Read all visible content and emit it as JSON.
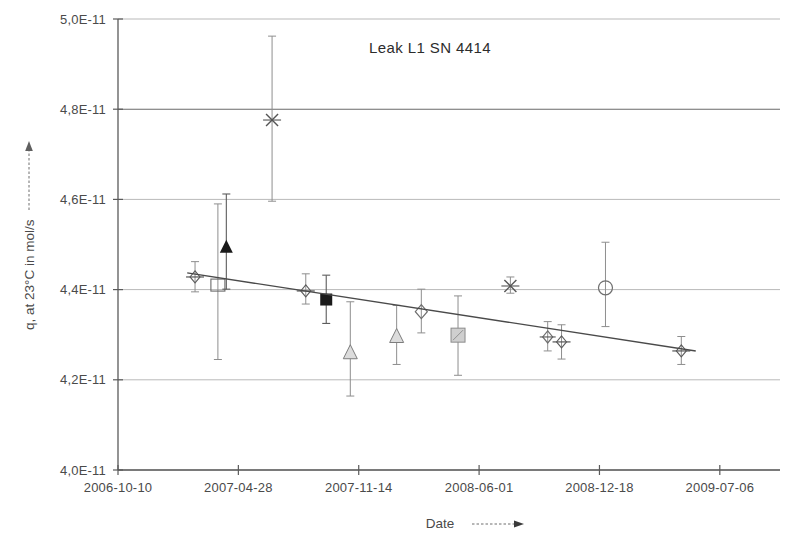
{
  "chart_data": {
    "type": "scatter",
    "title": "Leak L1 SN 4414",
    "xlabel": "Date",
    "ylabel": "q, at 23°C in mol/s",
    "xlabel_arrow": "→",
    "ylabel_arrow": "↑",
    "grid": true,
    "legend": "none",
    "ylim": [
      4e-11,
      5e-11
    ],
    "ytick_labels": [
      "5,0E-11",
      "4,8E-11",
      "4,6E-11",
      "4,4E-11",
      "4,2E-11",
      "4,0E-11"
    ],
    "ytick_values": [
      5e-11,
      4.8e-11,
      4.6e-11,
      4.4e-11,
      4.2e-11,
      4e-11
    ],
    "xtick_labels": [
      "2006-10-10",
      "2007-04-28",
      "2007-11-14",
      "2008-06-01",
      "2008-12-18",
      "2009-07-06"
    ],
    "xtick_values": [
      0,
      200,
      400,
      600,
      800,
      1000
    ],
    "xlim": [
      0,
      1100
    ],
    "points": [
      {
        "label": "2007-02-20",
        "x": 128,
        "y": 4.428e-11,
        "err_low": 4.395e-11,
        "err_high": 4.462e-11,
        "marker": "plus-diamond",
        "fill": "#555555"
      },
      {
        "label": "2007-03-28",
        "x": 166,
        "y": 4.41e-11,
        "err_low": 4.245e-11,
        "err_high": 4.59e-11,
        "marker": "open-square",
        "fill": "none"
      },
      {
        "label": "2007-05-02",
        "x": 180,
        "y": 4.493e-11,
        "err_low": 4.401e-11,
        "err_high": 4.612e-11,
        "marker": "filled-triangle",
        "fill": "#1a1a1a"
      },
      {
        "label": "2007-06-14",
        "x": 256,
        "y": 4.776e-11,
        "err_low": 4.596e-11,
        "err_high": 4.962e-11,
        "marker": "x-cross",
        "fill": "#555555"
      },
      {
        "label": "2007-08-10",
        "x": 312,
        "y": 4.397e-11,
        "err_low": 4.368e-11,
        "err_high": 4.435e-11,
        "marker": "plus-diamond",
        "fill": "#555555"
      },
      {
        "label": "2007-10-12",
        "x": 346,
        "y": 4.378e-11,
        "err_low": 4.325e-11,
        "err_high": 4.432e-11,
        "marker": "filled-square",
        "fill": "#1a1a1a"
      },
      {
        "label": "2007-12-01",
        "x": 386,
        "y": 4.26e-11,
        "err_low": 4.164e-11,
        "err_high": 4.373e-11,
        "marker": "open-triangle",
        "fill": "#d6d6d6"
      },
      {
        "label": "2008-02-20",
        "x": 463,
        "y": 4.296e-11,
        "err_low": 4.234e-11,
        "err_high": 4.365e-11,
        "marker": "open-triangle",
        "fill": "#d6d6d6"
      },
      {
        "label": "2008-04-01",
        "x": 504,
        "y": 4.351e-11,
        "err_low": 4.304e-11,
        "err_high": 4.401e-11,
        "marker": "open-diamond",
        "fill": "none"
      },
      {
        "label": "2008-06-20",
        "x": 565,
        "y": 4.299e-11,
        "err_low": 4.21e-11,
        "err_high": 4.386e-11,
        "marker": "grey-square",
        "fill": "#c9c9c9"
      },
      {
        "label": "2008-09-01",
        "x": 652,
        "y": 4.408e-11,
        "err_low": 4.392e-11,
        "err_high": 4.428e-11,
        "marker": "x-cross",
        "fill": "#555555"
      },
      {
        "label": "2008-11-05",
        "x": 714,
        "y": 4.295e-11,
        "err_low": 4.264e-11,
        "err_high": 4.329e-11,
        "marker": "open-diamond-small",
        "fill": "none"
      },
      {
        "label": "2008-12-01",
        "x": 737,
        "y": 4.284e-11,
        "err_low": 4.246e-11,
        "err_high": 4.322e-11,
        "marker": "plus-diamond",
        "fill": "#555555"
      },
      {
        "label": "2009-01-20",
        "x": 810,
        "y": 4.404e-11,
        "err_low": 4.318e-11,
        "err_high": 4.505e-11,
        "marker": "open-circle",
        "fill": "none"
      },
      {
        "label": "2009-03-15",
        "x": 936,
        "y": 4.264e-11,
        "err_low": 4.234e-11,
        "err_high": 4.296e-11,
        "marker": "plus-diamond",
        "fill": "#555555"
      }
    ],
    "trend": {
      "x_start": 115,
      "y_start": 4.437e-11,
      "x_end": 960,
      "y_end": 4.264e-11,
      "style": "solid"
    },
    "colors": {
      "grid": "#b9b9b9",
      "axis": "#5a5a5a",
      "trend": "#4a4a4a",
      "errorbar": "#8e8e8e",
      "text": "#4a4a4a"
    }
  }
}
